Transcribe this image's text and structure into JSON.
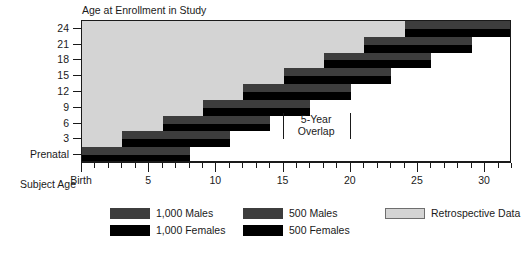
{
  "chart_data": {
    "type": "bar",
    "title": "",
    "ylabel": "Age at Enrollment in Study",
    "xlabel": "Subject Age",
    "xlim": [
      0,
      32
    ],
    "ylim_categories": [
      "Prenatal",
      "3",
      "6",
      "9",
      "12",
      "15",
      "18",
      "21",
      "24"
    ],
    "x_tick_labels": [
      {
        "value": 0,
        "label": "Birth"
      },
      {
        "value": 5,
        "label": "5"
      },
      {
        "value": 10,
        "label": "10"
      },
      {
        "value": 15,
        "label": "15"
      },
      {
        "value": 20,
        "label": "20"
      },
      {
        "value": 25,
        "label": "25"
      },
      {
        "value": 30,
        "label": "30"
      }
    ],
    "y_tick_labels": [
      "24",
      "21",
      "18",
      "15",
      "12",
      "9",
      "6",
      "3",
      "Prenatal"
    ],
    "grid": false,
    "legend_position": "bottom",
    "cohorts": [
      {
        "enrollment_age": "Prenatal",
        "start": 0,
        "end": 8,
        "retrospective_start": 0,
        "retrospective_end": 0
      },
      {
        "enrollment_age": "3",
        "start": 3,
        "end": 11,
        "retrospective_start": 0,
        "retrospective_end": 3
      },
      {
        "enrollment_age": "6",
        "start": 6,
        "end": 14,
        "retrospective_start": 0,
        "retrospective_end": 6
      },
      {
        "enrollment_age": "9",
        "start": 9,
        "end": 17,
        "retrospective_start": 0,
        "retrospective_end": 9
      },
      {
        "enrollment_age": "12",
        "start": 12,
        "end": 20,
        "retrospective_start": 0,
        "retrospective_end": 12
      },
      {
        "enrollment_age": "15",
        "start": 15,
        "end": 23,
        "retrospective_start": 0,
        "retrospective_end": 15
      },
      {
        "enrollment_age": "18",
        "start": 18,
        "end": 26,
        "retrospective_start": 0,
        "retrospective_end": 18
      },
      {
        "enrollment_age": "21",
        "start": 21,
        "end": 29,
        "retrospective_start": 0,
        "retrospective_end": 21
      },
      {
        "enrollment_age": "24",
        "start": 24,
        "end": 32,
        "retrospective_start": 0,
        "retrospective_end": 24
      }
    ],
    "series": [
      {
        "name": "1,000 Males",
        "color": "#3d3d3d"
      },
      {
        "name": "1,000 Females",
        "color": "#000000"
      },
      {
        "name": "500 Males",
        "color": "#3d3d3d"
      },
      {
        "name": "500 Females",
        "color": "#000000"
      },
      {
        "name": "Retrospective Data",
        "color": "#d4d4d4"
      }
    ],
    "annotations": [
      {
        "text": "5-Year\nOverlap",
        "x_start": 15,
        "x_end": 20
      }
    ]
  },
  "axes": {
    "y_title": "Age at Enrollment in Study",
    "x_title": "Subject Age"
  },
  "annotation": {
    "overlap_label": "5-Year\nOverlap"
  },
  "legend": {
    "items": [
      {
        "label": "1,000 Males",
        "swatch": "dark-gray-swatch"
      },
      {
        "label": "1,000 Females",
        "swatch": "black-swatch"
      },
      {
        "label": "500 Males",
        "swatch": "dark-gray-swatch"
      },
      {
        "label": "500 Females",
        "swatch": "black-swatch"
      },
      {
        "label": "Retrospective Data",
        "swatch": "light-gray-swatch"
      }
    ]
  },
  "colors": {
    "male": "#3d3d3d",
    "female": "#000000",
    "retrospective": "#d4d4d4",
    "axis": "#1a1a1a"
  }
}
